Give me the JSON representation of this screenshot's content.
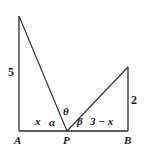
{
  "figure": {
    "type": "geometry-diagram",
    "stroke_color": "#2b2b2b",
    "background_color": "#ffffff",
    "text_color": "#1a1a1a",
    "points": {
      "A": {
        "x": 19,
        "y": 131
      },
      "P": {
        "x": 67,
        "y": 131
      },
      "B": {
        "x": 128,
        "y": 131
      },
      "left_apex": {
        "x": 19,
        "y": 16
      },
      "right_apex": {
        "x": 128,
        "y": 67
      }
    },
    "vertex_labels": {
      "a": "A",
      "p": "P",
      "b": "B"
    },
    "side_labels": {
      "left_height": "5",
      "right_height": "2",
      "left_base": "x",
      "right_base": "3 − x"
    },
    "angle_labels": {
      "alpha": "α",
      "theta": "θ",
      "beta": "β"
    }
  }
}
